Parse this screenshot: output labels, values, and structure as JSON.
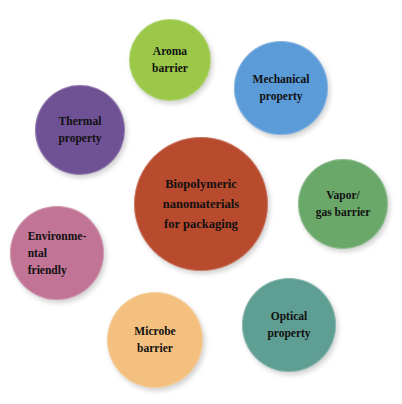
{
  "diagram": {
    "center": {
      "label": "Biopolymeric\nnanomaterials\nfor packaging",
      "color": "#b84a2e",
      "cx": 201,
      "cy": 204,
      "r": 67
    },
    "nodes": [
      {
        "id": "aroma",
        "label": "Aroma\nbarrier",
        "color": "#9cc84a",
        "cx": 170,
        "cy": 60,
        "r": 41
      },
      {
        "id": "mechanical",
        "label": "Mechanical\nproperty",
        "color": "#5b9bd8",
        "cx": 281,
        "cy": 88,
        "r": 47
      },
      {
        "id": "thermal",
        "label": "Thermal\nproperty",
        "color": "#6f5295",
        "cx": 80,
        "cy": 130,
        "r": 45
      },
      {
        "id": "vapor",
        "label": "Vapor/\ngas barrier",
        "color": "#6aa86a",
        "cx": 343,
        "cy": 204,
        "r": 45
      },
      {
        "id": "environmental",
        "label": "Environme-\nntal\nfriendly",
        "color": "#c17495",
        "cx": 57,
        "cy": 253,
        "r": 47
      },
      {
        "id": "optical",
        "label": "Optical\nproperty",
        "color": "#5f9e92",
        "cx": 289,
        "cy": 325,
        "r": 47
      },
      {
        "id": "microbe",
        "label": "Microbe\nbarrier",
        "color": "#f3c07f",
        "cx": 155,
        "cy": 340,
        "r": 48
      }
    ]
  }
}
